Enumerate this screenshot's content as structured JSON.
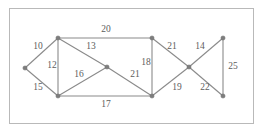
{
  "figure": {
    "title": "",
    "border_color": "#b9b9b9",
    "background_color": "#ffffff",
    "edge_color": "#8a8a8a",
    "node_color": "#7d7d7d",
    "label_color": "#5d5d5d"
  },
  "graph": {
    "type": "weighted-undirected-graph",
    "node_count": 9,
    "edge_count": 14,
    "nodes": [
      {
        "id": "n1",
        "name": "left-vertex",
        "x": 25,
        "y": 68
      },
      {
        "id": "n2",
        "name": "top-left-vertex",
        "x": 58,
        "y": 38
      },
      {
        "id": "n3",
        "name": "bottom-left-vertex",
        "x": 58,
        "y": 96
      },
      {
        "id": "n4",
        "name": "center-vertex",
        "x": 107,
        "y": 67
      },
      {
        "id": "n5",
        "name": "top-right-inner-vertex",
        "x": 152,
        "y": 38
      },
      {
        "id": "n6",
        "name": "bottom-right-inner-vertex",
        "x": 152,
        "y": 96
      },
      {
        "id": "n7",
        "name": "crossing-vertex",
        "x": 189,
        "y": 67
      },
      {
        "id": "n8",
        "name": "top-right-vertex",
        "x": 223,
        "y": 38
      },
      {
        "id": "n9",
        "name": "bottom-right-vertex",
        "x": 223,
        "y": 96
      }
    ],
    "edges": [
      {
        "id": "e1",
        "from": "n1",
        "to": "n2",
        "weight": "10",
        "label_x": 38,
        "label_y": 47
      },
      {
        "id": "e2",
        "from": "n1",
        "to": "n3",
        "weight": "15",
        "label_x": 38,
        "label_y": 88
      },
      {
        "id": "e3",
        "from": "n2",
        "to": "n3",
        "weight": "12",
        "label_x": 52,
        "label_y": 66
      },
      {
        "id": "e4",
        "from": "n2",
        "to": "n4",
        "weight": "13",
        "label_x": 91,
        "label_y": 47
      },
      {
        "id": "e5",
        "from": "n2",
        "to": "n5",
        "weight": "20",
        "label_x": 106,
        "label_y": 30
      },
      {
        "id": "e6",
        "from": "n3",
        "to": "n4",
        "weight": "16",
        "label_x": 79,
        "label_y": 75
      },
      {
        "id": "e7",
        "from": "n3",
        "to": "n6",
        "weight": "17",
        "label_x": 106,
        "label_y": 105
      },
      {
        "id": "e8",
        "from": "n4",
        "to": "n6",
        "weight": "21",
        "label_x": 135,
        "label_y": 75
      },
      {
        "id": "e9",
        "from": "n5",
        "to": "n6",
        "weight": "18",
        "label_x": 146,
        "label_y": 63
      },
      {
        "id": "e10",
        "from": "n5",
        "to": "n7",
        "weight": "21",
        "label_x": 172,
        "label_y": 47
      },
      {
        "id": "e11",
        "from": "n6",
        "to": "n7",
        "weight": "19",
        "label_x": 177,
        "label_y": 88
      },
      {
        "id": "e12",
        "from": "n7",
        "to": "n8",
        "weight": "14",
        "label_x": 200,
        "label_y": 47
      },
      {
        "id": "e13",
        "from": "n7",
        "to": "n9",
        "weight": "22",
        "label_x": 205,
        "label_y": 88
      },
      {
        "id": "e14",
        "from": "n8",
        "to": "n9",
        "weight": "25",
        "label_x": 233,
        "label_y": 67
      }
    ]
  }
}
